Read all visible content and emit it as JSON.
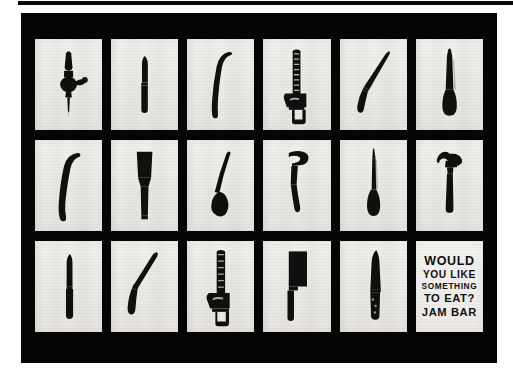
{
  "artwork": {
    "title": "Would You Like Something To Eat? Jam Bar",
    "frame_color": "#050505",
    "paper_color": "#eceae6",
    "object_color": "#100f0e",
    "grid": {
      "rows": 3,
      "columns": 6
    }
  },
  "cells": [
    {
      "id": "r1c1",
      "object": "hand-drill",
      "label": "hand drill"
    },
    {
      "id": "r1c2",
      "object": "folding-knife",
      "label": "folding knife"
    },
    {
      "id": "r1c3",
      "object": "curved-blade",
      "label": "curved blade"
    },
    {
      "id": "r1c4",
      "object": "handsaw",
      "label": "handsaw"
    },
    {
      "id": "r1c5",
      "object": "curved-knife",
      "label": "curved knife"
    },
    {
      "id": "r1c6",
      "object": "file-rasp",
      "label": "file"
    },
    {
      "id": "r2c1",
      "object": "sickle-blade",
      "label": "sickle blade"
    },
    {
      "id": "r2c2",
      "object": "chisel",
      "label": "chisel"
    },
    {
      "id": "r2c3",
      "object": "ladle",
      "label": "ladle"
    },
    {
      "id": "r2c4",
      "object": "hatchet",
      "label": "hatchet"
    },
    {
      "id": "r2c5",
      "object": "awl",
      "label": "awl"
    },
    {
      "id": "r2c6",
      "object": "claw-hammer",
      "label": "claw hammer"
    },
    {
      "id": "r3c1",
      "object": "pocket-knife",
      "label": "pocket knife"
    },
    {
      "id": "r3c2",
      "object": "boning-knife",
      "label": "boning knife"
    },
    {
      "id": "r3c3",
      "object": "bow-saw",
      "label": "saw"
    },
    {
      "id": "r3c4",
      "object": "cleaver",
      "label": "cleaver"
    },
    {
      "id": "r3c5",
      "object": "chefs-knife",
      "label": "chef's knife"
    }
  ],
  "text_panel": {
    "line1": "WOULD",
    "line2": "YOU LIKE",
    "line3": "SOMETHING",
    "line4": "TO EAT?",
    "line5": "JAM BAR"
  }
}
